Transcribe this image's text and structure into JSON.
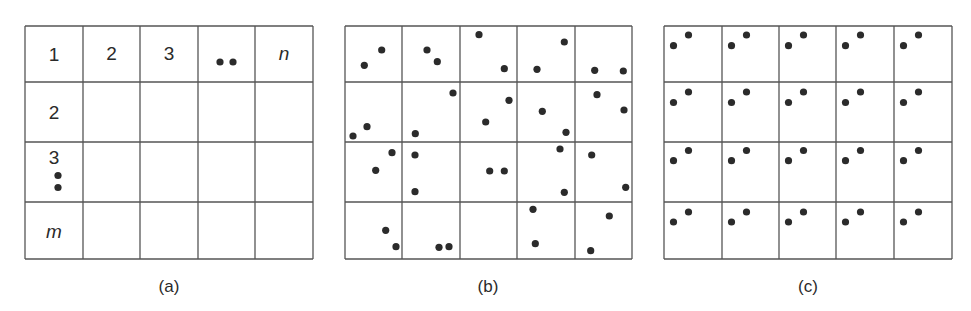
{
  "figure": {
    "panels": [
      {
        "id": "a",
        "caption": "(a)",
        "grid": {
          "x": 25,
          "y": 26,
          "cols": [
            25,
            83,
            140,
            198,
            255,
            313
          ],
          "rows": [
            26,
            82,
            142,
            202,
            259
          ]
        },
        "header_row": [
          "1",
          "2",
          "3",
          "••",
          "n"
        ],
        "header_col": [
          "1",
          "2",
          "3",
          "m"
        ]
      },
      {
        "id": "b",
        "caption": "(b)",
        "grid": {
          "cols": [
            345,
            402,
            460,
            517,
            575,
            632
          ],
          "rows": [
            26,
            82,
            142,
            202,
            259
          ]
        },
        "dots": [
          [
            381.7,
            50
          ],
          [
            364.3,
            65.3
          ],
          [
            427,
            50
          ],
          [
            437.3,
            61.7
          ],
          [
            479,
            34.7
          ],
          [
            504.3,
            68.7
          ],
          [
            564.3,
            42
          ],
          [
            537,
            69.3
          ],
          [
            594.7,
            70.3
          ],
          [
            623.3,
            71
          ],
          [
            367,
            126.7
          ],
          [
            353,
            136
          ],
          [
            453,
            93
          ],
          [
            415.3,
            133.7
          ],
          [
            509,
            100.3
          ],
          [
            485.7,
            122
          ],
          [
            542.3,
            111.3
          ],
          [
            566,
            132.3
          ],
          [
            597,
            94.7
          ],
          [
            624,
            110
          ],
          [
            392,
            152.7
          ],
          [
            375.7,
            170.3
          ],
          [
            415,
            155
          ],
          [
            415,
            191.7
          ],
          [
            489.7,
            171
          ],
          [
            504.3,
            171
          ],
          [
            560,
            149
          ],
          [
            564.3,
            192.3
          ],
          [
            591.7,
            155
          ],
          [
            625.7,
            187.3
          ],
          [
            385.7,
            230.3
          ],
          [
            396,
            246.7
          ],
          [
            439,
            247.3
          ],
          [
            449,
            246.7
          ],
          [
            533,
            209.3
          ],
          [
            535.3,
            243.7
          ],
          [
            609.3,
            216
          ],
          [
            590.7,
            250.7
          ]
        ]
      },
      {
        "id": "c",
        "caption": "(c)",
        "grid": {
          "cols": [
            664,
            722,
            779,
            836,
            894,
            952
          ],
          "rows": [
            26,
            82,
            142,
            202,
            259
          ]
        },
        "dot_pattern": {
          "dx1": 9,
          "dy1": 20,
          "dx2": 24,
          "dy2": 9
        },
        "row_dot_y": [
          [
            45.7,
            35
          ],
          [
            102.5,
            92
          ],
          [
            160.7,
            150.5
          ],
          [
            222,
            212
          ]
        ]
      }
    ],
    "colors": {
      "line": "#555555",
      "dot": "#2b2b2b",
      "text": "#2a2a2a"
    }
  }
}
